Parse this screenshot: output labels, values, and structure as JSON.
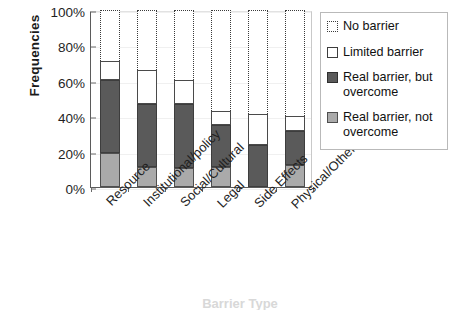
{
  "chart_data": {
    "type": "bar",
    "subtype": "stacked-bar-vertical",
    "title": "",
    "xlabel": "Barrier Type",
    "ylabel": "Frequencies",
    "ylim": [
      0,
      100
    ],
    "yticks": [
      "0%",
      "20%",
      "40%",
      "60%",
      "80%",
      "100%"
    ],
    "ytick_values": [
      0,
      20,
      40,
      60,
      80,
      100
    ],
    "grid": false,
    "legend_position": "right",
    "units": "percent",
    "categories": [
      "Resource",
      "Institutional/policy",
      "Social/Cultural",
      "Legal",
      "Side Effects",
      "Physical/Other"
    ],
    "series": [
      {
        "name": "Real barrier, not overcome",
        "color": "#aaaaaa",
        "values": [
          19,
          11.5,
          11,
          11.5,
          0,
          12.5
        ]
      },
      {
        "name": "Real barrier, but overcome",
        "color": "#5a5a5a",
        "values": [
          41.5,
          35.5,
          36,
          23.5,
          23.5,
          19
        ]
      },
      {
        "name": "Limited barrier",
        "color": "#ffffff",
        "values": [
          10.5,
          19,
          13.5,
          8,
          18,
          8.5
        ]
      },
      {
        "name": "No barrier",
        "color": "#ffffff",
        "pattern": "dotted-outline",
        "values": [
          29,
          34,
          39.5,
          57,
          58.5,
          60
        ]
      }
    ],
    "bar_totals_visible": [
      71,
      66,
      60.5,
      43,
      41.5,
      40
    ]
  },
  "axes": {
    "y_title": "Frequencies",
    "x_title_cutoff": "Barrier Type",
    "tick_labels": [
      "100%",
      "80%",
      "60%",
      "40%",
      "20%",
      "0%"
    ]
  },
  "legend": {
    "items": [
      {
        "label": "No barrier",
        "swatch": "dotted-outline-swatch"
      },
      {
        "label": "Limited barrier",
        "swatch": "white-square-swatch"
      },
      {
        "label": "Real barrier, but overcome",
        "swatch": "dark-gray-square-swatch"
      },
      {
        "label": "Real barrier, not overcome",
        "swatch": "light-gray-square-swatch"
      }
    ]
  },
  "colors": {
    "real_not_overcome": "#aaaaaa",
    "real_but_overcome": "#5a5a5a",
    "limited_barrier": "#ffffff",
    "no_barrier": "#ffffff",
    "outline": "#3d3d3d",
    "axis": "#5b5b5b",
    "text": "#1a1a1a"
  }
}
